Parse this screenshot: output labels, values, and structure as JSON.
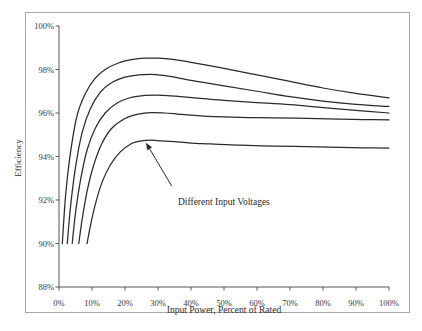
{
  "chart_data": {
    "type": "line",
    "title": "",
    "xlabel": "Input Power, Percent of Rated",
    "ylabel": "Efficiency",
    "xlim": [
      0,
      100
    ],
    "ylim": [
      88,
      100
    ],
    "grid": false,
    "legend": null,
    "xticks": [
      "0%",
      "10%",
      "20%",
      "30%",
      "40%",
      "50%",
      "60%",
      "70%",
      "80%",
      "90%",
      "100%"
    ],
    "xtick_values": [
      0,
      10,
      20,
      30,
      40,
      50,
      60,
      70,
      80,
      90,
      100
    ],
    "yticks": [
      "88%",
      "90%",
      "92%",
      "94%",
      "96%",
      "98%",
      "100%"
    ],
    "ytick_values": [
      88,
      90,
      92,
      94,
      96,
      98,
      100
    ],
    "annotations": [
      {
        "text": "Different Input Voltages",
        "text_x": 36,
        "text_y": 92.45,
        "arrow_to_x": 26.5,
        "arrow_to_y": 94.6
      }
    ],
    "series": [
      {
        "name": "Input Voltage 1",
        "color": "#2a2a2a",
        "x": [
          1.0,
          2.0,
          3.5,
          5.5,
          8.0,
          11.0,
          14.0,
          18.0,
          22.0,
          26.0,
          30.0,
          35.0,
          40.0,
          50.0,
          60.0,
          70.0,
          80.0,
          90.0,
          100.0
        ],
        "y": [
          90.0,
          92.2,
          94.2,
          95.9,
          96.9,
          97.6,
          98.0,
          98.3,
          98.45,
          98.52,
          98.52,
          98.45,
          98.33,
          98.05,
          97.75,
          97.45,
          97.15,
          96.9,
          96.7
        ]
      },
      {
        "name": "Input Voltage 2",
        "color": "#2a2a2a",
        "x": [
          2.5,
          3.5,
          5.0,
          7.0,
          9.5,
          12.5,
          16.0,
          20.0,
          24.0,
          28.0,
          32.0,
          36.0,
          40.0,
          50.0,
          60.0,
          70.0,
          80.0,
          90.0,
          100.0
        ],
        "y": [
          90.0,
          91.7,
          93.5,
          95.1,
          96.2,
          96.95,
          97.4,
          97.65,
          97.75,
          97.78,
          97.72,
          97.62,
          97.5,
          97.25,
          97.0,
          96.75,
          96.55,
          96.4,
          96.3
        ]
      },
      {
        "name": "Input Voltage 3",
        "color": "#2a2a2a",
        "x": [
          4.0,
          5.0,
          6.5,
          8.5,
          11.0,
          14.0,
          17.5,
          21.5,
          25.5,
          29.5,
          33.0,
          37.0,
          42.0,
          50.0,
          60.0,
          70.0,
          80.0,
          90.0,
          100.0
        ],
        "y": [
          90.0,
          91.4,
          92.9,
          94.3,
          95.3,
          96.0,
          96.45,
          96.7,
          96.8,
          96.82,
          96.8,
          96.75,
          96.68,
          96.58,
          96.48,
          96.38,
          96.25,
          96.12,
          96.0
        ]
      },
      {
        "name": "Input Voltage 4",
        "color": "#2a2a2a",
        "x": [
          6.0,
          7.0,
          8.5,
          10.5,
          13.0,
          16.0,
          20.0,
          24.0,
          28.0,
          32.0,
          36.0,
          40.0,
          45.0,
          55.0,
          65.0,
          75.0,
          85.0,
          92.0,
          100.0
        ],
        "y": [
          90.0,
          91.1,
          92.4,
          93.6,
          94.6,
          95.3,
          95.75,
          95.95,
          96.02,
          96.0,
          95.95,
          95.9,
          95.85,
          95.8,
          95.78,
          95.75,
          95.72,
          95.7,
          95.68
        ]
      },
      {
        "name": "Input Voltage 5",
        "color": "#2a2a2a",
        "x": [
          8.5,
          9.5,
          11.0,
          13.0,
          15.5,
          18.5,
          22.0,
          25.0,
          28.0,
          31.0,
          35.0,
          40.0,
          46.0,
          55.0,
          65.0,
          75.0,
          85.0,
          92.0,
          100.0
        ],
        "y": [
          90.0,
          90.8,
          91.8,
          92.8,
          93.6,
          94.2,
          94.6,
          94.72,
          94.75,
          94.72,
          94.68,
          94.62,
          94.58,
          94.52,
          94.48,
          94.45,
          94.42,
          94.4,
          94.38
        ]
      }
    ]
  },
  "figure": {
    "border_color": "#a8a8a8",
    "axis_color": "#555555",
    "text_color": "#2b2b2b"
  }
}
